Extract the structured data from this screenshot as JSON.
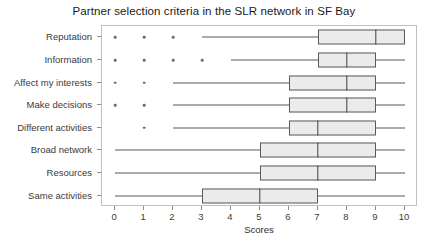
{
  "chart_data": {
    "type": "boxplot",
    "title": "Partner selection criteria in the SLR network in SF Bay",
    "xlabel": "Scores",
    "ylabel": "",
    "xlim": [
      -0.45,
      10.45
    ],
    "xticks": [
      0,
      1,
      2,
      3,
      4,
      5,
      6,
      7,
      8,
      9,
      10
    ],
    "xticklabels": [
      "0",
      "1",
      "2",
      "3",
      "4",
      "5",
      "6",
      "7",
      "8",
      "9",
      "10"
    ],
    "grid": false,
    "legend": "none",
    "orientation": "horizontal",
    "categories": [
      "Reputation",
      "Information",
      "Affect my interests",
      "Make decisions",
      "Different activities",
      "Broad network",
      "Resources",
      "Same activities"
    ],
    "boxes": [
      {
        "category": "Reputation",
        "whisker_low": 3,
        "q1": 7,
        "median": 9,
        "q3": 10,
        "whisker_high": 10,
        "outliers": [
          0,
          1,
          2
        ]
      },
      {
        "category": "Information",
        "whisker_low": 4,
        "q1": 7,
        "median": 8,
        "q3": 9,
        "whisker_high": 10,
        "outliers": [
          0,
          1,
          2,
          3
        ]
      },
      {
        "category": "Affect my interests",
        "whisker_low": 2,
        "q1": 6,
        "median": 8,
        "q3": 9,
        "whisker_high": 10,
        "outliers": [
          0,
          1
        ]
      },
      {
        "category": "Make decisions",
        "whisker_low": 2,
        "q1": 6,
        "median": 8,
        "q3": 9,
        "whisker_high": 10,
        "outliers": [
          0,
          1
        ]
      },
      {
        "category": "Different activities",
        "whisker_low": 2,
        "q1": 6,
        "median": 7,
        "q3": 9,
        "whisker_high": 10,
        "outliers": [
          1
        ]
      },
      {
        "category": "Broad network",
        "whisker_low": 0,
        "q1": 5,
        "median": 7,
        "q3": 9,
        "whisker_high": 10,
        "outliers": []
      },
      {
        "category": "Resources",
        "whisker_low": 0,
        "q1": 5,
        "median": 7,
        "q3": 9,
        "whisker_high": 10,
        "outliers": []
      },
      {
        "category": "Same activities",
        "whisker_low": 0,
        "q1": 3,
        "median": 5,
        "q3": 7,
        "whisker_high": 10,
        "outliers": []
      }
    ],
    "colors": {
      "box_fill": "#ebebeb",
      "box_edge": "#5a5a5a",
      "median": "#404040",
      "whisker": "#595959",
      "outlier": "#6e6e6e",
      "panel_border": "#bfbfbf",
      "background": "#ffffff",
      "text": "#2b2b2b"
    }
  }
}
